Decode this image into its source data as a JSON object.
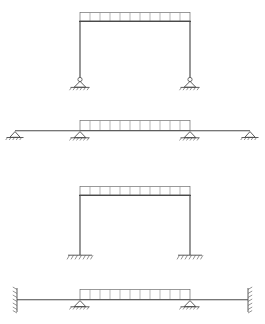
{
  "figure": {
    "background_color": "#ffffff",
    "line_color": "#4a4a4a",
    "load_color": "#6e6e6e",
    "hatch_color": "#5a5a5a"
  },
  "geometry": {
    "canvas_width": 265,
    "canvas_height": 324,
    "left_column_x": 80,
    "right_column_x": 190,
    "span_left_x": 15,
    "span_right_x": 250,
    "load_segments": 11
  },
  "panels": [
    {
      "id": "panel-1",
      "name": "portal-frame-pinned",
      "label": "Portal frame on pinned supports",
      "support_type": "pinned",
      "orientation": "upright",
      "beam_y": 18,
      "base_y": 85,
      "load_box_top": 13,
      "load_box_bottom": 21,
      "has_ground_line": false
    },
    {
      "id": "panel-2",
      "name": "rotated-frame-pinned",
      "label": "Rotated frame on pinned supports",
      "support_type": "pinned",
      "orientation": "flat",
      "beam_y": 131,
      "load_box_top": 120,
      "load_box_bottom": 131,
      "has_ground_line": false
    },
    {
      "id": "panel-3",
      "name": "portal-frame-fixed",
      "label": "Portal frame on fixed supports",
      "support_type": "fixed",
      "orientation": "upright",
      "beam_y": 192,
      "base_y": 255,
      "load_box_top": 187,
      "load_box_bottom": 195,
      "has_ground_line": true
    },
    {
      "id": "panel-4",
      "name": "rotated-frame-fixed",
      "label": "Rotated frame between fixed walls",
      "support_type": "fixed-wall",
      "orientation": "flat",
      "beam_y": 300,
      "load_box_top": 289,
      "load_box_bottom": 300,
      "has_ground_line": false
    }
  ],
  "support_symbols": {
    "pinned": "triangle-with-circle-and-ground-hatch",
    "fixed": "hatched-ground-line",
    "fixed_wall": "vertical-hatched-wall"
  },
  "load": {
    "type": "uniformly-distributed-load",
    "representation": "segmented-rectangular-box",
    "segments": 11
  }
}
